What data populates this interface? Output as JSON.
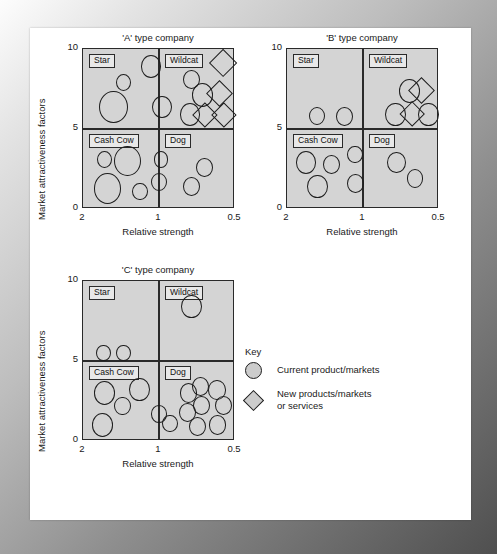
{
  "key": {
    "title": "Key",
    "items": [
      {
        "shape": "circle-icon",
        "label": "Current product/markets"
      },
      {
        "shape": "diamond-icon",
        "label": "New products/markets",
        "label2": "or services"
      }
    ]
  },
  "axes": {
    "x_label": "Relative strength",
    "y_label": "Market attractiveness factors",
    "x_ticks": [
      "2",
      "1",
      "0.5"
    ],
    "y_ticks": [
      "10",
      "5",
      "0"
    ]
  },
  "quadrant_labels": {
    "star": "Star",
    "wildcat": "Wildcat",
    "cash_cow": "Cash Cow",
    "dog": "Dog"
  },
  "chart_data": [
    {
      "type": "scatter",
      "title": "'A' type company",
      "xlabel": "Relative strength",
      "ylabel": "Market attractiveness factors",
      "xlim": [
        2,
        0.5
      ],
      "ylim": [
        0,
        10
      ],
      "x_ticks": [
        2,
        1,
        0.5
      ],
      "y_ticks": [
        0,
        5,
        10
      ],
      "quadrants": [
        "Star",
        "Wildcat",
        "Cash Cow",
        "Dog"
      ],
      "grid": false,
      "legend_position": "external-right",
      "points": [
        {
          "quadrant": "Star",
          "marker": "circle",
          "x": 1.33,
          "y": 8.9,
          "size": 3.2
        },
        {
          "quadrant": "Star",
          "marker": "circle",
          "x": 1.6,
          "y": 7.9,
          "size": 2.4
        },
        {
          "quadrant": "Star",
          "marker": "circle",
          "x": 1.7,
          "y": 6.4,
          "size": 4.4
        },
        {
          "quadrant": "Star",
          "marker": "circle",
          "x": 1.22,
          "y": 6.4,
          "size": 3.0
        },
        {
          "quadrant": "Wildcat",
          "marker": "circle",
          "x": 0.93,
          "y": 8.1,
          "size": 2.6
        },
        {
          "quadrant": "Wildcat",
          "marker": "circle",
          "x": 0.82,
          "y": 7.1,
          "size": 3.3
        },
        {
          "quadrant": "Wildcat",
          "marker": "circle",
          "x": 0.94,
          "y": 5.9,
          "size": 3.1
        },
        {
          "quadrant": "Wildcat",
          "marker": "diamond",
          "x": 0.62,
          "y": 9.1,
          "size": 3.4
        },
        {
          "quadrant": "Wildcat",
          "marker": "diamond",
          "x": 0.65,
          "y": 7.2,
          "size": 3.2
        },
        {
          "quadrant": "Wildcat",
          "marker": "diamond",
          "x": 0.8,
          "y": 5.9,
          "size": 3.0
        },
        {
          "quadrant": "Wildcat",
          "marker": "diamond",
          "x": 0.61,
          "y": 5.9,
          "size": 3.0
        },
        {
          "quadrant": "Cash Cow",
          "marker": "circle",
          "x": 1.79,
          "y": 3.1,
          "size": 2.3
        },
        {
          "quadrant": "Cash Cow",
          "marker": "circle",
          "x": 1.56,
          "y": 3.0,
          "size": 4.1
        },
        {
          "quadrant": "Cash Cow",
          "marker": "circle",
          "x": 1.23,
          "y": 3.1,
          "size": 2.3
        },
        {
          "quadrant": "Cash Cow",
          "marker": "circle",
          "x": 1.76,
          "y": 1.3,
          "size": 4.2
        },
        {
          "quadrant": "Cash Cow",
          "marker": "circle",
          "x": 1.44,
          "y": 1.1,
          "size": 2.4
        },
        {
          "quadrant": "Cash Cow",
          "marker": "circle",
          "x": 1.25,
          "y": 1.7,
          "size": 2.5
        },
        {
          "quadrant": "Dog",
          "marker": "circle",
          "x": 0.8,
          "y": 2.6,
          "size": 2.6
        },
        {
          "quadrant": "Dog",
          "marker": "circle",
          "x": 0.93,
          "y": 1.4,
          "size": 2.7
        }
      ]
    },
    {
      "type": "scatter",
      "title": "'B' type company",
      "xlabel": "Relative strength",
      "ylabel": "Market attractiveness factors",
      "xlim": [
        2,
        0.5
      ],
      "ylim": [
        0,
        10
      ],
      "x_ticks": [
        2,
        1,
        0.5
      ],
      "y_ticks": [
        0,
        5,
        10
      ],
      "quadrants": [
        "Star",
        "Wildcat",
        "Cash Cow",
        "Dog"
      ],
      "grid": false,
      "points": [
        {
          "quadrant": "Star",
          "marker": "circle",
          "x": 1.7,
          "y": 5.8,
          "size": 2.5
        },
        {
          "quadrant": "Star",
          "marker": "circle",
          "x": 1.43,
          "y": 5.8,
          "size": 2.6
        },
        {
          "quadrant": "Wildcat",
          "marker": "circle",
          "x": 0.79,
          "y": 7.4,
          "size": 3.3
        },
        {
          "quadrant": "Wildcat",
          "marker": "circle",
          "x": 0.93,
          "y": 5.9,
          "size": 3.2
        },
        {
          "quadrant": "Wildcat",
          "marker": "circle",
          "x": 0.6,
          "y": 5.9,
          "size": 3.2
        },
        {
          "quadrant": "Wildcat",
          "marker": "diamond",
          "x": 0.67,
          "y": 7.4,
          "size": 3.2
        },
        {
          "quadrant": "Wildcat",
          "marker": "diamond",
          "x": 0.76,
          "y": 5.9,
          "size": 3.1
        },
        {
          "quadrant": "Cash Cow",
          "marker": "circle",
          "x": 1.81,
          "y": 2.9,
          "size": 3.1
        },
        {
          "quadrant": "Cash Cow",
          "marker": "circle",
          "x": 1.56,
          "y": 2.8,
          "size": 2.6
        },
        {
          "quadrant": "Cash Cow",
          "marker": "circle",
          "x": 1.33,
          "y": 3.4,
          "size": 2.4
        },
        {
          "quadrant": "Cash Cow",
          "marker": "circle",
          "x": 1.7,
          "y": 1.4,
          "size": 3.2
        },
        {
          "quadrant": "Cash Cow",
          "marker": "circle",
          "x": 1.32,
          "y": 1.6,
          "size": 2.6
        },
        {
          "quadrant": "Dog",
          "marker": "circle",
          "x": 0.92,
          "y": 2.9,
          "size": 2.9
        },
        {
          "quadrant": "Dog",
          "marker": "circle",
          "x": 0.74,
          "y": 1.9,
          "size": 2.5
        }
      ]
    },
    {
      "type": "scatter",
      "title": "'C' type company",
      "xlabel": "Relative strength",
      "ylabel": "Market attractiveness factors",
      "xlim": [
        2,
        0.5
      ],
      "ylim": [
        0,
        10
      ],
      "x_ticks": [
        2,
        1,
        0.5
      ],
      "y_ticks": [
        0,
        5,
        10
      ],
      "quadrants": [
        "Star",
        "Wildcat",
        "Cash Cow",
        "Dog"
      ],
      "grid": false,
      "points": [
        {
          "quadrant": "Star",
          "marker": "circle",
          "x": 1.8,
          "y": 5.5,
          "size": 2.3
        },
        {
          "quadrant": "Star",
          "marker": "circle",
          "x": 1.6,
          "y": 5.5,
          "size": 2.3
        },
        {
          "quadrant": "Wildcat",
          "marker": "circle",
          "x": 0.93,
          "y": 8.4,
          "size": 3.2
        },
        {
          "quadrant": "Cash Cow",
          "marker": "circle",
          "x": 1.79,
          "y": 3.0,
          "size": 3.3
        },
        {
          "quadrant": "Cash Cow",
          "marker": "circle",
          "x": 1.61,
          "y": 2.2,
          "size": 2.5
        },
        {
          "quadrant": "Cash Cow",
          "marker": "circle",
          "x": 1.44,
          "y": 3.2,
          "size": 3.2
        },
        {
          "quadrant": "Cash Cow",
          "marker": "circle",
          "x": 1.81,
          "y": 1.0,
          "size": 3.3
        },
        {
          "quadrant": "Cash Cow",
          "marker": "circle",
          "x": 1.25,
          "y": 1.7,
          "size": 2.4
        },
        {
          "quadrant": "Cash Cow",
          "marker": "circle",
          "x": 1.14,
          "y": 1.1,
          "size": 2.4
        },
        {
          "quadrant": "Dog",
          "marker": "circle",
          "x": 0.96,
          "y": 3.0,
          "size": 2.7
        },
        {
          "quadrant": "Dog",
          "marker": "circle",
          "x": 0.84,
          "y": 3.4,
          "size": 2.7
        },
        {
          "quadrant": "Dog",
          "marker": "circle",
          "x": 0.68,
          "y": 3.2,
          "size": 2.7
        },
        {
          "quadrant": "Dog",
          "marker": "circle",
          "x": 0.97,
          "y": 1.8,
          "size": 2.6
        },
        {
          "quadrant": "Dog",
          "marker": "circle",
          "x": 0.83,
          "y": 2.2,
          "size": 2.6
        },
        {
          "quadrant": "Dog",
          "marker": "circle",
          "x": 0.61,
          "y": 2.2,
          "size": 2.6
        },
        {
          "quadrant": "Dog",
          "marker": "circle",
          "x": 0.87,
          "y": 0.9,
          "size": 2.7
        },
        {
          "quadrant": "Dog",
          "marker": "circle",
          "x": 0.67,
          "y": 1.0,
          "size": 2.6
        }
      ]
    }
  ],
  "panels": [
    {
      "id": "A",
      "left": 48,
      "top": 20,
      "plot_left": 52,
      "plot_top": 20,
      "plot_w": 152,
      "plot_h": 160
    },
    {
      "id": "B",
      "left": 252,
      "top": 20,
      "plot_left": 52,
      "plot_top": 20,
      "plot_w": 152,
      "plot_h": 160
    },
    {
      "id": "C",
      "left": 48,
      "top": 255,
      "plot_left": 52,
      "plot_top": 20,
      "plot_w": 152,
      "plot_h": 160
    }
  ]
}
